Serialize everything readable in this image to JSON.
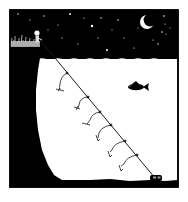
{
  "panel": {
    "title": "Night fishing comic panel",
    "colors": {
      "sky": "#000000",
      "water": "#ffffff",
      "ground": "#000000",
      "line": "#1a1a1a",
      "moon": "#ffffff",
      "star": "#ffffff"
    },
    "elements": {
      "sky": "night-sky",
      "moon": "crescent-moon-icon",
      "stars": "star-icon",
      "cliff": "cliff",
      "person": "person-icon",
      "fishing_line": "fishing-line",
      "hooks": "hook-icon",
      "fish": "fish-icon",
      "weight": "sinker-icon"
    },
    "hook_count": 6
  }
}
